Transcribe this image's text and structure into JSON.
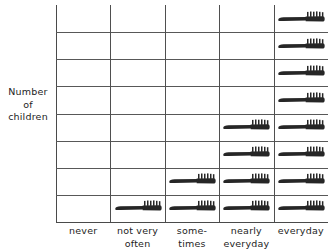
{
  "chart_data": {
    "type": "bar",
    "subtype": "pictograph",
    "title": "",
    "xlabel": "",
    "ylabel": "Number of children",
    "ylabel_lines": [
      "Number",
      "of",
      "children"
    ],
    "categories": [
      "never",
      "not very often",
      "some-times",
      "nearly everyday",
      "everyday"
    ],
    "category_label_lines": [
      [
        "never"
      ],
      [
        "not very",
        "often"
      ],
      [
        "some-",
        "times"
      ],
      [
        "nearly",
        "everyday"
      ],
      [
        "everyday"
      ]
    ],
    "values": [
      0,
      1,
      2,
      4,
      8
    ],
    "icon": "toothbrush-icon",
    "icon_unit_value": 1,
    "ylim": [
      0,
      8
    ],
    "y_gridlines": 8,
    "grid": true,
    "legend": false,
    "tick_labels_y": [],
    "annotations": []
  },
  "colors": {
    "background": "#ffffff",
    "grid_line": "#585858",
    "axis_line": "#4a4a4a",
    "icon_fill": "#262626",
    "text": "#1d1d1d"
  }
}
